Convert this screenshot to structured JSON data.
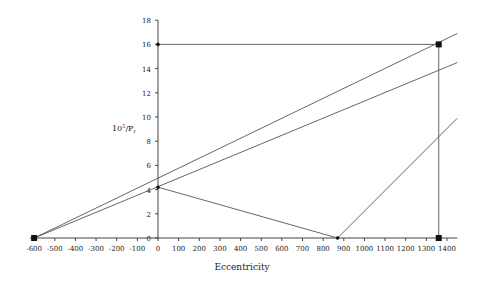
{
  "chart_data": {
    "type": "line",
    "title": "",
    "xlabel": "Eccentricity",
    "ylabel_base": "10",
    "ylabel_sup": "5",
    "ylabel_rest": "/P",
    "ylabel_sub": "r",
    "xlim": [
      -620,
      1450
    ],
    "ylim": [
      0,
      18
    ],
    "x_ticks": [
      -600,
      -500,
      -400,
      -300,
      -200,
      -100,
      0,
      100,
      200,
      300,
      400,
      500,
      600,
      700,
      800,
      900,
      1000,
      1100,
      1200,
      1300,
      1400
    ],
    "y_ticks": [
      0,
      2,
      4,
      6,
      8,
      10,
      12,
      14,
      16,
      18
    ],
    "grid": false,
    "legend": null,
    "series": [
      {
        "name": "upper-line",
        "x": [
          -600,
          1450
        ],
        "y": [
          0,
          16.9
        ]
      },
      {
        "name": "lower-line",
        "x": [
          -600,
          1450
        ],
        "y": [
          0,
          14.5
        ]
      },
      {
        "name": "v-line-left",
        "x": [
          0,
          870
        ],
        "y": [
          4.2,
          0
        ]
      },
      {
        "name": "v-line-right",
        "x": [
          870,
          1450
        ],
        "y": [
          0,
          9.9
        ]
      },
      {
        "name": "ref-horizontal",
        "x": [
          0,
          1360
        ],
        "y": [
          16,
          16
        ]
      },
      {
        "name": "ref-vertical",
        "x": [
          1360,
          1360
        ],
        "y": [
          0,
          16
        ]
      }
    ],
    "markers": [
      {
        "x": -600,
        "y": 0,
        "shape": "square"
      },
      {
        "x": 1360,
        "y": 16,
        "shape": "square"
      },
      {
        "x": 1360,
        "y": 0,
        "shape": "square"
      },
      {
        "x": 0,
        "y": 4.2,
        "shape": "dot"
      },
      {
        "x": 870,
        "y": 0,
        "shape": "dot"
      },
      {
        "x": 0,
        "y": 16,
        "shape": "dot"
      }
    ]
  }
}
